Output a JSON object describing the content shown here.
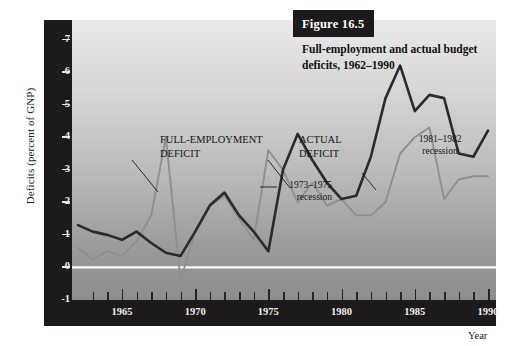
{
  "figure": {
    "number_label": "Figure 16.5",
    "title": "Full-employment and actual budget deficits, 1962–1990"
  },
  "axes": {
    "y_title": "Deficits (percent of GNP)",
    "x_title": "Year",
    "y_ticks": [
      "7",
      "6",
      "5",
      "4",
      "3",
      "2",
      "1",
      "0",
      "-1"
    ],
    "x_ticks": [
      "1965",
      "1970",
      "1975",
      "1980",
      "1985",
      "1990"
    ]
  },
  "annotations": {
    "full_employment": "FULL-EMPLOYMENT\nDEFICIT",
    "full_employment_line1": "FULL-EMPLOYMENT",
    "full_employment_line2": "DEFICIT",
    "actual_line1": "ACTUAL",
    "actual_line2": "DEFICIT",
    "recession_7375_line1": "1973–1975",
    "recession_7375_line2": "recession",
    "recession_8182_line1": "1981–1982",
    "recession_8182_line2": "recession"
  },
  "colors": {
    "full_employment_line": "#2b2b2b",
    "actual_line": "#8f8f8f",
    "axis_bar": "#1c1a1b",
    "zero_line": "#ffffff",
    "plot_top": "#e9e9e9",
    "plot_bottom": "#8d8d8d"
  },
  "chart_data": {
    "type": "line",
    "title": "Full-employment and actual budget deficits, 1962–1990",
    "xlabel": "Year",
    "ylabel": "Deficits (percent of GNP)",
    "xlim": [
      1962,
      1990
    ],
    "ylim": [
      -1,
      7.6
    ],
    "grid": false,
    "legend_position": "in-plot annotations",
    "zero_line": 0,
    "x": [
      1962,
      1963,
      1964,
      1965,
      1966,
      1967,
      1968,
      1969,
      1970,
      1971,
      1972,
      1973,
      1974,
      1975,
      1976,
      1977,
      1978,
      1979,
      1980,
      1981,
      1982,
      1983,
      1984,
      1985,
      1986,
      1987,
      1988,
      1989,
      1990
    ],
    "series": [
      {
        "name": "FULL-EMPLOYMENT DEFICIT",
        "color": "#2b2b2b",
        "values": [
          1.3,
          1.1,
          1.0,
          0.85,
          1.1,
          0.75,
          0.45,
          0.35,
          1.1,
          1.9,
          2.3,
          1.6,
          1.1,
          0.5,
          3.0,
          4.1,
          3.3,
          2.6,
          2.1,
          2.2,
          3.4,
          5.2,
          6.2,
          4.8,
          5.3,
          5.2,
          3.5,
          3.4,
          4.2
        ]
      },
      {
        "name": "ACTUAL DEFICIT",
        "color": "#8f8f8f",
        "values": [
          0.6,
          0.25,
          0.5,
          0.35,
          0.8,
          1.6,
          4.0,
          -0.4,
          1.1,
          1.9,
          2.2,
          1.5,
          0.85,
          3.6,
          3.0,
          2.0,
          2.6,
          1.9,
          2.1,
          1.6,
          1.6,
          2.0,
          3.5,
          4.0,
          4.3,
          2.1,
          2.7,
          2.8,
          2.8
        ]
      }
    ]
  }
}
